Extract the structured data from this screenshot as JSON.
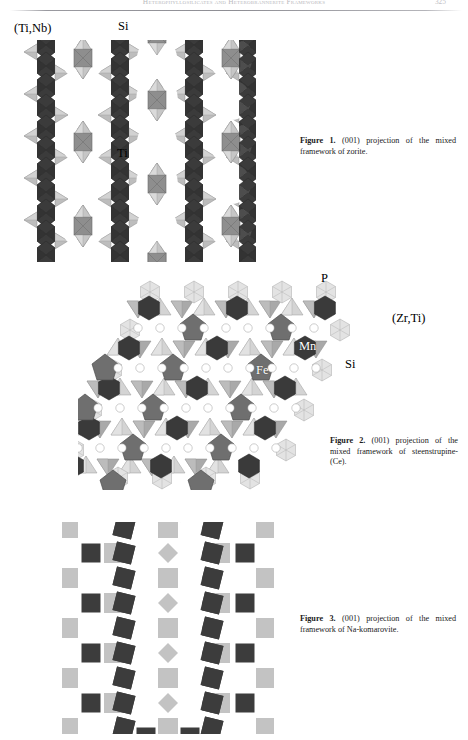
{
  "page": {
    "running_head": "Heterophyllosilicates and Heterobrannerite Frameworks",
    "page_number": "325"
  },
  "figures": [
    {
      "id": "figure-1",
      "caption_label": "Figure 1.",
      "caption_text": " (001) projection of the mixed framework of zorite.",
      "labels": [
        {
          "name": "ti-nb-label",
          "text": "(Ti,Nb)"
        },
        {
          "name": "si-label",
          "text": "Si"
        },
        {
          "name": "ti-label",
          "text": "Ti"
        }
      ]
    },
    {
      "id": "figure-2",
      "caption_label": "Figure 2.",
      "caption_text": " (001) projection of the mixed framework of steenstrupine-(Ce).",
      "labels": [
        {
          "name": "p-label",
          "text": "P"
        },
        {
          "name": "zr-ti-label",
          "text": "(Zr,Ti)"
        },
        {
          "name": "mn-label",
          "text": "Mn"
        },
        {
          "name": "fe-label",
          "text": "Fe"
        },
        {
          "name": "si-label",
          "text": "Si"
        }
      ]
    },
    {
      "id": "figure-3",
      "caption_label": "Figure 3.",
      "caption_text": " (001) projection of the mixed framework of Na-komarovite.",
      "labels": []
    }
  ],
  "colors": {
    "dark_polyhedron": "#3b3b3b",
    "mid_polyhedron": "#8e8e8e",
    "light_polyhedron": "#c9c9c9",
    "very_light_polyhedron": "#dedede",
    "outline": "#7a7a7a",
    "page_background": "#ffffff",
    "text": "#111111",
    "running_head_text": "#bdbdc1"
  }
}
